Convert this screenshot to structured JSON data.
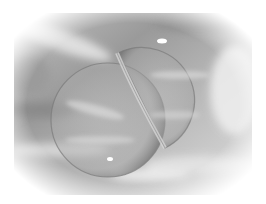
{
  "image": {
    "subject": "Two merged soap bubbles floating against a cloudy sky",
    "style": "grayscale photograph",
    "colors": {
      "background": "#ffffff",
      "sky_dark": "#8a8a8a",
      "sky_mid": "#b4b4b4",
      "sky_light": "#e6e6e6",
      "bubble_rim": "#6e6e6e",
      "highlight": "#ffffff"
    }
  }
}
